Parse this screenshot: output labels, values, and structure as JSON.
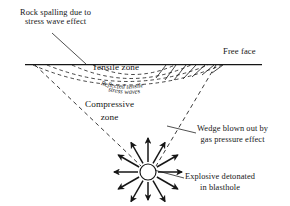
{
  "diagram": {
    "background_color": "#ffffff",
    "line_color": "#161616",
    "labels": {
      "rock_spalling": "Rock spalling due to\nstress wave effect",
      "free_face": "Free face",
      "tensile_zone": "Tensile zone",
      "reflected_tensile_1": "Reflected tensile",
      "reflected_tensile_2": "stress waves",
      "compressive_zone_line1": "Compressive",
      "compressive_zone_line2": "zone",
      "wedge": "Wedge blown out by\ngas pressure effect",
      "explosive": "Explosive detonated\nin blasthole"
    },
    "elements": {
      "ground_line_name": "free-face-ground-line",
      "blasthole_name": "blasthole-circle",
      "wedge_name": "wedge-v-lines",
      "arrows_name": "gas-pressure-arrows",
      "hatching_name": "spall-hatching",
      "arcs_name": "reflected-stress-wave-arcs"
    },
    "geometry": {
      "ground_line_y": 64,
      "ground_line_x1": 25,
      "ground_line_x2": 262,
      "blasthole_cx": 148,
      "blasthole_cy": 172,
      "blasthole_r": 8,
      "wedge_left_x": 35,
      "wedge_right_x": 216,
      "arrow_count": 12
    }
  }
}
